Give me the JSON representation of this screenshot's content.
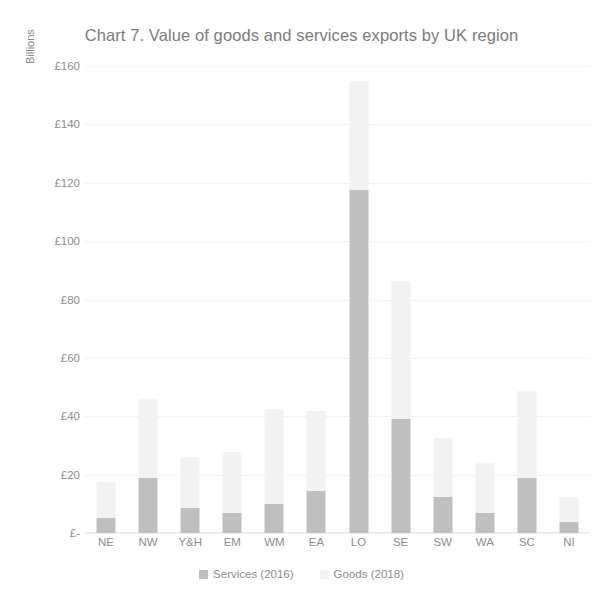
{
  "chart_data": {
    "type": "bar",
    "subtype": "stacked-bar",
    "title": "Chart 7. Value of goods and services exports by UK region",
    "xlabel": "",
    "ylabel": "Billions",
    "ylim": [
      0,
      160
    ],
    "ytick_labels": [
      "£160",
      "£140",
      "£120",
      "£100",
      "£80",
      "£60",
      "£40",
      "£20",
      "£-"
    ],
    "ytick_values": [
      160,
      140,
      120,
      100,
      80,
      60,
      40,
      20,
      0
    ],
    "grid": true,
    "legend_position": "bottom",
    "categories": [
      "NE",
      "NW",
      "Y&H",
      "EM",
      "WM",
      "EA",
      "LO",
      "SE",
      "SW",
      "WA",
      "SC",
      "NI"
    ],
    "series": [
      {
        "name": "Services (2016)",
        "color": "#bfbfbf",
        "values": [
          5.2,
          18.9,
          8.7,
          6.8,
          10.0,
          14.3,
          117.5,
          39.2,
          12.5,
          6.7,
          18.8,
          3.9
        ]
      },
      {
        "name": "Goods (2018)",
        "color": "#f2f2f2",
        "values": [
          12.3,
          26.9,
          17.2,
          21.1,
          32.6,
          27.4,
          37.4,
          47.2,
          20.2,
          17.4,
          29.8,
          8.5
        ]
      }
    ],
    "totals": [
      17.5,
      45.8,
      25.9,
      27.9,
      42.6,
      41.7,
      154.9,
      86.4,
      32.7,
      24.1,
      48.6,
      12.4
    ]
  },
  "legend": {
    "items": [
      {
        "label": "Services (2016)",
        "color": "#bfbfbf"
      },
      {
        "label": "Goods (2018)",
        "color": "#f2f2f2"
      }
    ]
  },
  "colors": {
    "title": "#7b7b7b",
    "tick": "#8c8c8c",
    "gridline": "#f2f2f2",
    "services": "#bfbfbf",
    "goods": "#f2f2f2",
    "background": "#ffffff"
  }
}
